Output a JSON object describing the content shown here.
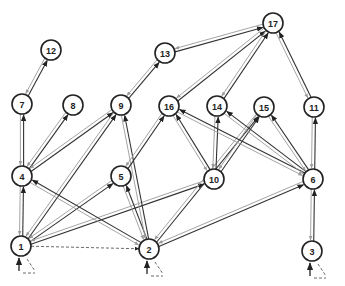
{
  "diagram": {
    "title": "",
    "type": "directed-graph",
    "nodes": [
      {
        "id": "1",
        "label": "1",
        "x": 21,
        "y": 246
      },
      {
        "id": "2",
        "label": "2",
        "x": 149,
        "y": 249
      },
      {
        "id": "3",
        "label": "3",
        "x": 312,
        "y": 251
      },
      {
        "id": "4",
        "label": "4",
        "x": 22,
        "y": 176
      },
      {
        "id": "5",
        "label": "5",
        "x": 121,
        "y": 176
      },
      {
        "id": "6",
        "label": "6",
        "x": 313,
        "y": 179
      },
      {
        "id": "7",
        "label": "7",
        "x": 22,
        "y": 104
      },
      {
        "id": "8",
        "label": "8",
        "x": 73,
        "y": 105
      },
      {
        "id": "9",
        "label": "9",
        "x": 121,
        "y": 105
      },
      {
        "id": "10",
        "label": "10",
        "x": 214,
        "y": 179
      },
      {
        "id": "11",
        "label": "11",
        "x": 314,
        "y": 107
      },
      {
        "id": "12",
        "label": "12",
        "x": 51,
        "y": 50
      },
      {
        "id": "13",
        "label": "13",
        "x": 165,
        "y": 53
      },
      {
        "id": "14",
        "label": "14",
        "x": 217,
        "y": 106
      },
      {
        "id": "15",
        "label": "15",
        "x": 264,
        "y": 107
      },
      {
        "id": "16",
        "label": "16",
        "x": 169,
        "y": 106
      },
      {
        "id": "17",
        "label": "17",
        "x": 273,
        "y": 23
      }
    ],
    "edges": [
      {
        "from": "1",
        "to": "4",
        "style": "bidirectional"
      },
      {
        "from": "4",
        "to": "7",
        "style": "bidirectional"
      },
      {
        "from": "7",
        "to": "12",
        "style": "bidirectional"
      },
      {
        "from": "4",
        "to": "8",
        "style": "bidirectional"
      },
      {
        "from": "4",
        "to": "9",
        "style": "bidirectional"
      },
      {
        "from": "1",
        "to": "9",
        "style": "bidirectional"
      },
      {
        "from": "1",
        "to": "5",
        "style": "bidirectional"
      },
      {
        "from": "1",
        "to": "10",
        "style": "bidirectional"
      },
      {
        "from": "1",
        "to": "2",
        "style": "dashed"
      },
      {
        "from": "2",
        "to": "4",
        "style": "bidirectional"
      },
      {
        "from": "2",
        "to": "5",
        "style": "bidirectional"
      },
      {
        "from": "2",
        "to": "9",
        "style": "bidirectional"
      },
      {
        "from": "2",
        "to": "15",
        "style": "bidirectional"
      },
      {
        "from": "2",
        "to": "6",
        "style": "bidirectional"
      },
      {
        "from": "5",
        "to": "16",
        "style": "bidirectional"
      },
      {
        "from": "9",
        "to": "13",
        "style": "bidirectional"
      },
      {
        "from": "13",
        "to": "17",
        "style": "bidirectional"
      },
      {
        "from": "16",
        "to": "17",
        "style": "bidirectional"
      },
      {
        "from": "14",
        "to": "17",
        "style": "bidirectional"
      },
      {
        "from": "11",
        "to": "17",
        "style": "bidirectional"
      },
      {
        "from": "10",
        "to": "16",
        "style": "bidirectional"
      },
      {
        "from": "10",
        "to": "14",
        "style": "bidirectional"
      },
      {
        "from": "10",
        "to": "15",
        "style": "bidirectional"
      },
      {
        "from": "6",
        "to": "16",
        "style": "bidirectional"
      },
      {
        "from": "6",
        "to": "14",
        "style": "bidirectional"
      },
      {
        "from": "6",
        "to": "15",
        "style": "bidirectional"
      },
      {
        "from": "6",
        "to": "11",
        "style": "bidirectional"
      },
      {
        "from": "3",
        "to": "6",
        "style": "bidirectional"
      }
    ],
    "start_nodes": [
      "1",
      "2",
      "3"
    ],
    "colors": {
      "forward_edge": "#333333",
      "return_edge": "#9a9a9a",
      "node_stroke": "#222222"
    }
  }
}
